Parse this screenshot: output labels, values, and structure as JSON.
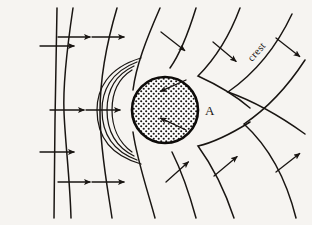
{
  "figure": {
    "name": "wave-refraction-around-circular-island",
    "background_color": "#f6f4f1",
    "ink_color": "#191512",
    "width": 312,
    "height": 225
  },
  "labels": {
    "crest": "crest",
    "point_a": "A"
  },
  "island": {
    "name": "circular-island",
    "center_x": 165,
    "center_y": 110,
    "radius": 33,
    "fill_pattern": "stipple-dots",
    "outline_color": "#0d0b09"
  },
  "chart_data": {
    "type": "line",
    "title": "",
    "xlabel": "",
    "ylabel": "",
    "crests": [
      {
        "id": "crest-1",
        "path": "M 57 8 L 55 120 L 54 218",
        "kind": "incident-straight"
      },
      {
        "id": "crest-2",
        "path": "M 73 8 C 66 55 63 90 64 112 C 65 140 70 180 71 218",
        "kind": "incident-curved"
      },
      {
        "id": "crest-3",
        "path": "M 117 8 C 106 45 100 80 100 112 C 100 150 108 190 112 218",
        "kind": "incident-curved"
      },
      {
        "id": "crest-4",
        "path": "M 160 8 C 146 40 136 66 133 90",
        "kind": "refracted-upper"
      },
      {
        "id": "crest-5",
        "path": "M 133 132 C 137 160 148 192 155 218",
        "kind": "refracted-lower"
      },
      {
        "id": "crest-6",
        "path": "M 196 8 C 188 34 180 54 170 68",
        "kind": "refracted-upper"
      },
      {
        "id": "crest-7",
        "path": "M 172 152 C 182 172 190 196 196 218",
        "kind": "refracted-lower"
      },
      {
        "id": "crest-8",
        "path": "M 240 8 C 228 40 212 62 198 76 C 220 86 236 96 250 108",
        "kind": "diffracted-upper"
      },
      {
        "id": "crest-9",
        "path": "M 250 122 C 234 132 216 142 198 146 C 214 168 226 194 234 218",
        "kind": "diffracted-lower"
      },
      {
        "id": "crest-10",
        "path": "M 292 14 C 276 48 254 74 228 92 C 256 102 280 116 305 134",
        "kind": "diffracted-outer-upper"
      },
      {
        "id": "crest-11",
        "path": "M 305 60 C 288 86 268 108 244 124 C 268 146 286 178 296 218",
        "kind": "diffracted-outer-lower"
      }
    ],
    "wrap_arcs": [
      {
        "id": "wrap-1",
        "path": "M 132 70 C 116 80 112 96 112 110 C 112 126 118 142 132 152"
      },
      {
        "id": "wrap-2",
        "path": "M 134 66 C 113 76 107 94 107 110 C 107 128 114 146 134 156"
      },
      {
        "id": "wrap-3",
        "path": "M 137 62 C 110 72 102 92 102 110 C 102 130 110 150 137 160"
      },
      {
        "id": "wrap-4",
        "path": "M 141 58 C 107 68 97 90 97 110 C 97 132 106 154 141 164"
      }
    ],
    "arrows": [
      {
        "id": "arrow-1",
        "x": 40,
        "y": 46,
        "angle": 0,
        "length": 34
      },
      {
        "id": "arrow-2",
        "x": 40,
        "y": 152,
        "angle": 0,
        "length": 34
      },
      {
        "id": "arrow-3",
        "x": 58,
        "y": 37,
        "angle": 0,
        "length": 32
      },
      {
        "id": "arrow-4",
        "x": 50,
        "y": 110,
        "angle": 0,
        "length": 34
      },
      {
        "id": "arrow-5",
        "x": 58,
        "y": 182,
        "angle": 0,
        "length": 32
      },
      {
        "id": "arrow-6",
        "x": 92,
        "y": 37,
        "angle": 0,
        "length": 32
      },
      {
        "id": "arrow-7",
        "x": 86,
        "y": 110,
        "angle": 0,
        "length": 34
      },
      {
        "id": "arrow-8",
        "x": 92,
        "y": 182,
        "angle": 0,
        "length": 32
      },
      {
        "id": "arrow-9",
        "x": 161,
        "y": 32,
        "angle": 38,
        "length": 30
      },
      {
        "id": "arrow-10",
        "x": 213,
        "y": 42,
        "angle": 40,
        "length": 30
      },
      {
        "id": "arrow-11",
        "x": 276,
        "y": 38,
        "angle": 38,
        "length": 30
      },
      {
        "id": "arrow-12",
        "x": 186,
        "y": 80,
        "angle": 156,
        "length": 28
      },
      {
        "id": "arrow-13",
        "x": 186,
        "y": 130,
        "angle": 205,
        "length": 28
      },
      {
        "id": "arrow-14",
        "x": 166,
        "y": 182,
        "angle": -42,
        "length": 30
      },
      {
        "id": "arrow-15",
        "x": 214,
        "y": 176,
        "angle": -40,
        "length": 30
      },
      {
        "id": "arrow-16",
        "x": 276,
        "y": 172,
        "angle": -38,
        "length": 30
      }
    ]
  }
}
